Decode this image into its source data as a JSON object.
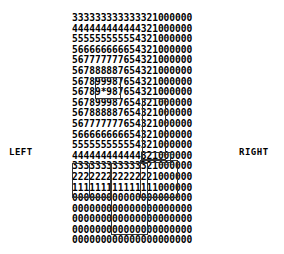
{
  "labels": {
    "left": "LEFT",
    "right": "RIGHT"
  },
  "grid": {
    "rows": [
      "333333333333321000000",
      "444444444444321000000",
      "555555555554321000000",
      "566666666654321000000",
      "567777777654321000000",
      "567888887654321000000",
      "567899987654321000000",
      "56789*987654321000000",
      "567899987654321000000",
      "567888887654321000000",
      "567777777654321000000",
      "566666666654321000000",
      "555555555554321000000",
      "444444444444321000000",
      "333333333333321000000",
      "222222222222221000000",
      "111111111111111000000",
      "000000000000000000000",
      "000000000000000000000",
      "000000000000000000000",
      "000000000000000000000",
      "000000000000000000000"
    ],
    "center_marker": "*"
  },
  "boxes": [
    {
      "name": "center-box",
      "x": 95,
      "y": 77,
      "w": 26,
      "h": 22
    },
    {
      "name": "right-column-box",
      "x": 142,
      "y": 98,
      "w": 24,
      "h": 62
    },
    {
      "name": "row-3210-box",
      "x": 141,
      "y": 152,
      "w": 30,
      "h": 11
    },
    {
      "name": "lower-right-box",
      "x": 140,
      "y": 160,
      "w": 38,
      "h": 38
    },
    {
      "name": "lower-left-box-a",
      "x": 72,
      "y": 163,
      "w": 18,
      "h": 35
    },
    {
      "name": "lower-left-box-b",
      "x": 89,
      "y": 163,
      "w": 22,
      "h": 35
    },
    {
      "name": "lower-middle-box",
      "x": 111,
      "y": 163,
      "w": 37,
      "h": 72
    }
  ]
}
